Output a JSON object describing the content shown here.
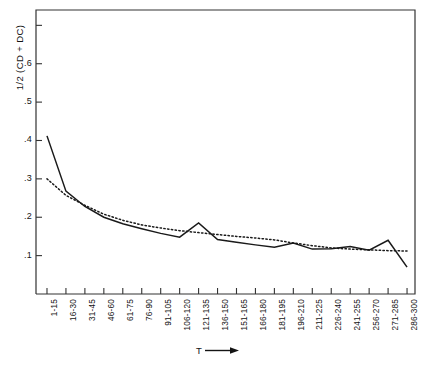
{
  "chart_data": {
    "type": "line",
    "title": "",
    "subtitle": "",
    "ylabel": "1/2 (CD + DC)",
    "xlabel": "T",
    "xlabel_suffix_icon": "right-arrow-icon",
    "grid": false,
    "legend": "none",
    "ylim": [
      0.0,
      0.74
    ],
    "ytick_values": [
      0.1,
      0.2,
      0.3,
      0.4,
      0.5,
      0.6,
      0.7
    ],
    "ytick_labels": [
      ".1",
      ".2",
      ".3",
      ".4",
      ".5",
      ".6",
      ""
    ],
    "categories": [
      "1-15",
      "16-30",
      "31-45",
      "46-60",
      "61-75",
      "76-90",
      "91-105",
      "106-120",
      "121-135",
      "136-150",
      "151-165",
      "166-180",
      "181-195",
      "196-210",
      "211-225",
      "226-240",
      "241-255",
      "256-270",
      "271-285",
      "286-300"
    ],
    "series": [
      {
        "name": "solid-curve",
        "style": "solid",
        "color": "#1a1a1a",
        "values": [
          0.412,
          0.268,
          0.228,
          0.2,
          0.183,
          0.17,
          0.158,
          0.148,
          0.185,
          0.142,
          0.135,
          0.128,
          0.122,
          0.133,
          0.117,
          0.118,
          0.124,
          0.114,
          0.14,
          0.07
        ]
      },
      {
        "name": "dotted-curve",
        "style": "dotted",
        "color": "#1a1a1a",
        "values": [
          0.3,
          0.257,
          0.231,
          0.208,
          0.192,
          0.18,
          0.172,
          0.165,
          0.16,
          0.155,
          0.15,
          0.146,
          0.141,
          0.133,
          0.126,
          0.12,
          0.117,
          0.115,
          0.113,
          0.112
        ]
      }
    ]
  },
  "axes": {
    "frame_color": "#333333"
  }
}
